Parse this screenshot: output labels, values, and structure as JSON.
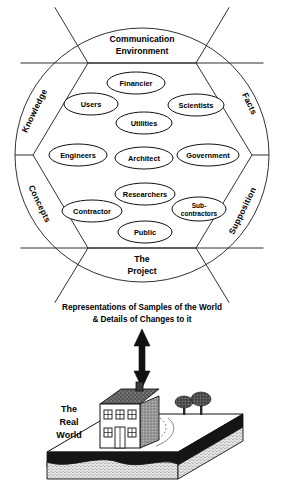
{
  "diagram": {
    "title_text": "Representations of Samples of the World",
    "subtitle_text": "& Details of Changes to it",
    "arrow": {
      "name": "vertical-double-arrow"
    },
    "circle": {
      "top_band": {
        "line1": "Communication",
        "line2": "Environment"
      },
      "bottom_band": {
        "line1": "The",
        "line2": "Project"
      },
      "sectors": [
        {
          "id": "knowledge",
          "label": "Knowledge"
        },
        {
          "id": "facts",
          "label": "Facts"
        },
        {
          "id": "concepts",
          "label": "Concepts"
        },
        {
          "id": "supposition",
          "label": "Supposition"
        }
      ]
    },
    "stakeholders": [
      {
        "id": "financier",
        "label": "Financier",
        "cx": 136,
        "cy": 83,
        "rx": 29,
        "ry": 11
      },
      {
        "id": "users",
        "label": "Users",
        "cx": 91,
        "cy": 104,
        "rx": 27,
        "ry": 11
      },
      {
        "id": "scientists",
        "label": "Scientists",
        "cx": 196,
        "cy": 105,
        "rx": 28,
        "ry": 11
      },
      {
        "id": "utilities",
        "label": "Utilities",
        "cx": 144,
        "cy": 123,
        "rx": 28,
        "ry": 11
      },
      {
        "id": "engineers",
        "label": "Engineers",
        "cx": 78,
        "cy": 155,
        "rx": 29,
        "ry": 11
      },
      {
        "id": "architect",
        "label": "Architect",
        "cx": 144,
        "cy": 158,
        "rx": 29,
        "ry": 11
      },
      {
        "id": "government",
        "label": "Government",
        "cx": 208,
        "cy": 155,
        "rx": 31,
        "ry": 11
      },
      {
        "id": "researchers",
        "label": "Researchers",
        "cx": 145,
        "cy": 194,
        "rx": 30,
        "ry": 11
      },
      {
        "id": "contractor",
        "label": "Contractor",
        "cx": 92,
        "cy": 211,
        "rx": 30,
        "ry": 11
      },
      {
        "id": "subcontractors",
        "label": "Sub-",
        "label2": "contractors",
        "cx": 199,
        "cy": 209,
        "rx": 27,
        "ry": 12
      },
      {
        "id": "public",
        "label": "Public",
        "cx": 145,
        "cy": 232,
        "rx": 27,
        "ry": 11
      }
    ],
    "real_world": {
      "line1": "The",
      "line2": "Real",
      "line3": "World"
    },
    "colors": {
      "ink": "#111111",
      "paper": "#ffffff",
      "roof": "#4a4a4a",
      "shade": "#8a8a8a",
      "soil": "#151515",
      "base": "#d9d9d9"
    }
  }
}
